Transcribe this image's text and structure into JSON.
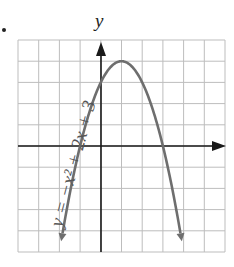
{
  "chart_data": {
    "type": "line",
    "title": "",
    "xlabel": "",
    "ylabel": "y",
    "equation_label": "y = −x² + 2x + 3",
    "xlim": [
      -4,
      6
    ],
    "ylim": [
      -5,
      5
    ],
    "grid": true,
    "legend": "none",
    "series": [
      {
        "name": "y = -x^2 + 2x + 3",
        "x": [
          -2.5,
          -2,
          -1.5,
          -1,
          -0.5,
          0,
          0.5,
          1,
          1.5,
          2,
          2.5,
          3,
          3.5,
          4,
          4.5
        ],
        "y": [
          -5.75,
          -5,
          -2.25,
          0,
          1.75,
          3,
          3.75,
          4,
          3.75,
          3,
          1.75,
          0,
          -2.25,
          -5,
          -5.75
        ]
      }
    ],
    "annotations": {
      "vertex": [
        1,
        4
      ],
      "x_intercepts": [
        -1,
        3
      ],
      "y_intercept": 3
    },
    "colors": {
      "curve": "#6e6e6e",
      "axes": "#1a1a1a",
      "grid": "#bdbdbd"
    }
  },
  "labels": {
    "y_axis": "y",
    "equation": "y = −x² + 2x + 3"
  }
}
